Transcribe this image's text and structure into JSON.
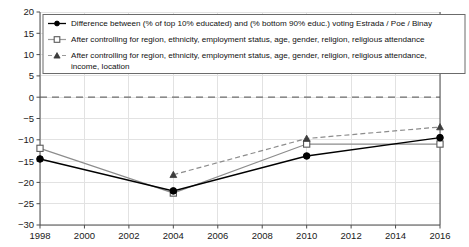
{
  "chart_data": {
    "type": "line",
    "title": "",
    "xlabel": "",
    "ylabel": "",
    "xlim": [
      1998,
      2016
    ],
    "ylim": [
      -30,
      20
    ],
    "grid": true,
    "legend_position": "top-left-inside",
    "zero_reference_line": true,
    "x": [
      1998,
      2004,
      2010,
      2016
    ],
    "xticks": [
      "1998",
      "2000",
      "2002",
      "2004",
      "2006",
      "2008",
      "2010",
      "2012",
      "2014",
      "2016"
    ],
    "yticks": [
      "20",
      "15",
      "10",
      "5",
      "0",
      "-5",
      "-10",
      "-15",
      "-20",
      "-25",
      "-30"
    ],
    "series": [
      {
        "name": "Difference between (% of top 10% educated) and (% bottom 90% educ.) voting Estrada / Poe / Binay",
        "marker": "filled-circle",
        "linestyle": "solid",
        "color": "#000000",
        "x": [
          1998,
          2004,
          2010,
          2016
        ],
        "values": [
          -14.5,
          -22.0,
          -13.8,
          -9.5
        ]
      },
      {
        "name": "After controlling for region, ethnicity, employment status, age, gender, religion, religious attendance",
        "marker": "open-square",
        "linestyle": "solid",
        "color": "#8c8c8c",
        "x": [
          1998,
          2004,
          2010,
          2016
        ],
        "values": [
          -12.0,
          -22.5,
          -11.0,
          -11.0
        ]
      },
      {
        "name": "After controlling for region, ethnicity, employment status, age, gender, religion, religious attendance, income, location",
        "marker": "filled-triangle",
        "linestyle": "dashed",
        "color": "#8c8c8c",
        "x": [
          2004,
          2010,
          2016
        ],
        "values": [
          -18.2,
          -9.7,
          -7.0
        ]
      }
    ]
  },
  "legend": {
    "entries": [
      {
        "label": "Difference between (% of top 10% educated) and (% bottom 90% educ.) voting Estrada / Poe / Binay",
        "line2": ""
      },
      {
        "label": "After controlling for region, ethnicity, employment status, age, gender, religion, religious attendance",
        "line2": ""
      },
      {
        "label": "After controlling for region, ethnicity, employment status, age, gender, religion, religious attendance,",
        "line2": "income, location"
      }
    ]
  },
  "axes": {
    "y_tick_labels": [
      "20",
      "15",
      "10",
      "5",
      "0",
      "−5",
      "−10",
      "−15",
      "−20",
      "−25",
      "−30"
    ],
    "x_tick_labels": [
      "1998",
      "2000",
      "2002",
      "2004",
      "2006",
      "2008",
      "2010",
      "2012",
      "2014",
      "2016"
    ]
  },
  "colors": {
    "series1": "#000000",
    "series2": "#8c8c8c",
    "series3": "#8c8c8c",
    "grid": "#e2e2e2",
    "axis": "#4d4d4d",
    "zero_line": "#6e6e6e",
    "background": "#ffffff"
  }
}
